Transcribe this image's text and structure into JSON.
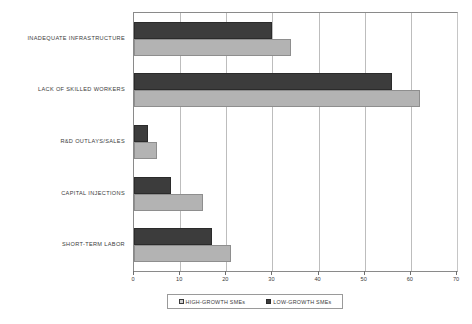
{
  "chart_data": {
    "type": "bar",
    "orientation": "horizontal",
    "title": "",
    "xlabel": "",
    "ylabel": "",
    "xlim": [
      0,
      70
    ],
    "xticks": [
      0,
      10,
      20,
      30,
      40,
      50,
      60,
      70
    ],
    "grid": true,
    "legend_position": "bottom",
    "categories": [
      "INADEQUATE INFRASTRUCTURE",
      "LACK OF SKILLED WORKERS",
      "R&D OUTLAYS/SALES",
      "CAPITAL INJECTIONS",
      "SHORT-TERM LABOR"
    ],
    "series": [
      {
        "name": "HIGH-GROWTH SMEs",
        "color": "#3c3c3c",
        "values": [
          30,
          56,
          3,
          8,
          17
        ]
      },
      {
        "name": "LOW-GROWTH SMEs",
        "color": "#b3b3b3",
        "values": [
          34,
          62,
          5,
          15,
          21
        ]
      }
    ]
  },
  "legend": {
    "entries": [
      {
        "label": "HIGH-GROWTH SMEs",
        "swatch": "high-growth-swatch-icon"
      },
      {
        "label": "LOW-GROWTH SMEs",
        "swatch": "low-growth-swatch-icon"
      }
    ]
  }
}
